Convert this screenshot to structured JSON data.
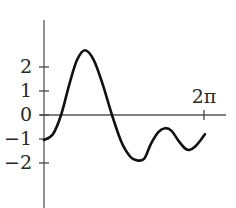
{
  "chart_data": {
    "type": "line",
    "title": "",
    "xlabel": "",
    "ylabel": "",
    "x_tick_labels": [
      "2π"
    ],
    "x_ticks": [
      6.2832
    ],
    "y_tick_labels": [
      "2",
      "1",
      "0",
      "−1",
      "−2"
    ],
    "y_ticks": [
      2,
      1,
      0,
      -1,
      -2
    ],
    "xlim": [
      0,
      7.0
    ],
    "ylim": [
      -3.9,
      3.9
    ],
    "grid": false,
    "legend": null,
    "series": [
      {
        "name": "f(x)",
        "color": "#111111",
        "x": [
          0.0,
          0.35,
          0.67,
          1.0,
          1.3,
          1.61,
          1.95,
          2.3,
          2.67,
          3.05,
          3.4,
          3.69,
          3.95,
          4.2,
          4.5,
          4.75,
          5.0,
          5.3,
          5.55,
          5.73,
          5.95,
          6.15,
          6.32
        ],
        "y": [
          -1.04,
          -0.8,
          0.0,
          1.3,
          2.3,
          2.7,
          2.3,
          1.3,
          0.0,
          -1.15,
          -1.75,
          -1.9,
          -1.8,
          -1.2,
          -0.7,
          -0.55,
          -0.65,
          -1.1,
          -1.4,
          -1.45,
          -1.3,
          -1.05,
          -0.8
        ]
      }
    ]
  },
  "axes": {
    "origin_px": {
      "x": 44,
      "y": 115
    },
    "x_unit_px": 25.46,
    "y_unit_px": 24,
    "y_axis_top_px": 20,
    "y_axis_bottom_px": 208,
    "x_axis_left_px": 40,
    "x_axis_right_px": 226
  }
}
